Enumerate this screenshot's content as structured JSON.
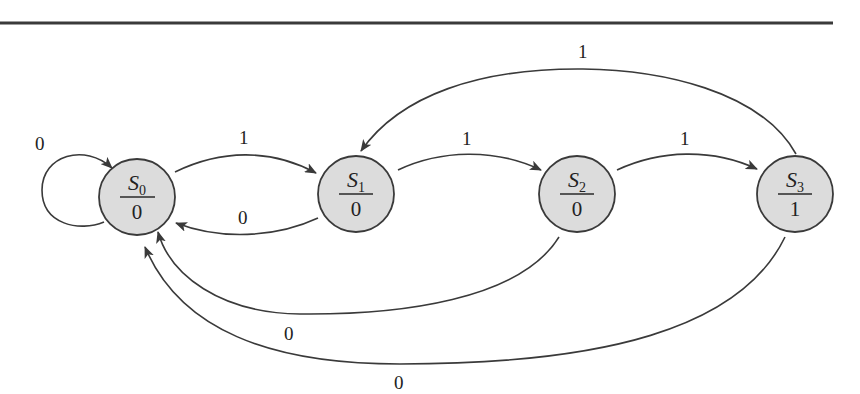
{
  "diagram": {
    "type": "state-machine (Moore)",
    "states": [
      {
        "id": "S0",
        "name": "S",
        "subscript": "0",
        "output": "0",
        "cx": 137,
        "cy": 197
      },
      {
        "id": "S1",
        "name": "S",
        "subscript": "1",
        "output": "0",
        "cx": 356,
        "cy": 194
      },
      {
        "id": "S2",
        "name": "S",
        "subscript": "2",
        "output": "0",
        "cx": 577,
        "cy": 194
      },
      {
        "id": "S3",
        "name": "S",
        "subscript": "3",
        "output": "1",
        "cx": 795,
        "cy": 194
      }
    ],
    "transitions": [
      {
        "from": "S0",
        "to": "S0",
        "input": "0"
      },
      {
        "from": "S0",
        "to": "S1",
        "input": "1"
      },
      {
        "from": "S1",
        "to": "S0",
        "input": "0"
      },
      {
        "from": "S1",
        "to": "S2",
        "input": "1"
      },
      {
        "from": "S2",
        "to": "S3",
        "input": "1"
      },
      {
        "from": "S3",
        "to": "S1",
        "input": "1"
      },
      {
        "from": "S2",
        "to": "S0",
        "input": "0"
      },
      {
        "from": "S3",
        "to": "S0",
        "input": "0"
      }
    ],
    "edge_labels": {
      "s0_self": "0",
      "s0_s1": "1",
      "s1_s0": "0",
      "s1_s2": "1",
      "s2_s3": "1",
      "s3_s1": "1",
      "s2_s0": "0",
      "s3_s0": "0"
    },
    "colors": {
      "node_fill": "#dcdcdc",
      "stroke": "#3a3a3a",
      "background": "#ffffff"
    }
  }
}
